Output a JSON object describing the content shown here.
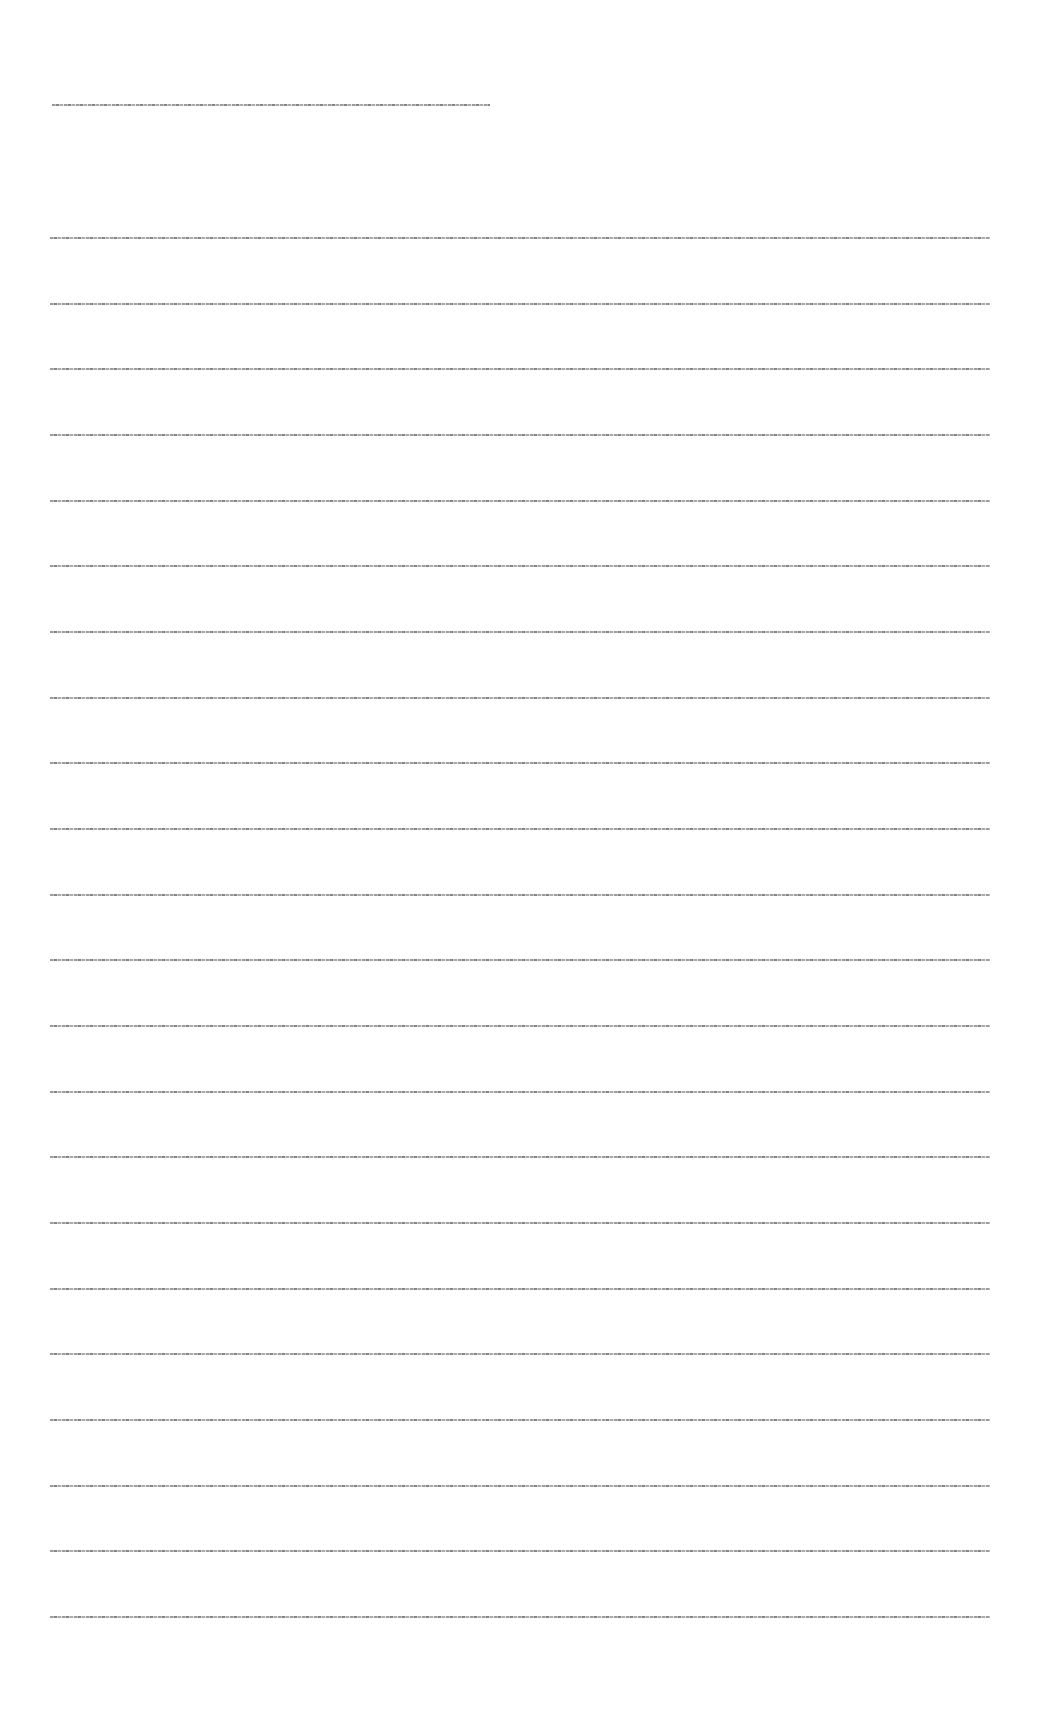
{
  "document": {
    "legibility": "text too small to read",
    "title_line": {
      "text": "",
      "x": 52,
      "y": 104,
      "width": 438
    },
    "body_lines": [
      {
        "text": "",
        "y": 237
      },
      {
        "text": "",
        "y": 303
      },
      {
        "text": "",
        "y": 368
      },
      {
        "text": "",
        "y": 434
      },
      {
        "text": "",
        "y": 500
      },
      {
        "text": "",
        "y": 565
      },
      {
        "text": "",
        "y": 631
      },
      {
        "text": "",
        "y": 697
      },
      {
        "text": "",
        "y": 762
      },
      {
        "text": "",
        "y": 828
      },
      {
        "text": "",
        "y": 894
      },
      {
        "text": "",
        "y": 959
      },
      {
        "text": "",
        "y": 1025
      },
      {
        "text": "",
        "y": 1091
      },
      {
        "text": "",
        "y": 1156
      },
      {
        "text": "",
        "y": 1222
      },
      {
        "text": "",
        "y": 1288
      },
      {
        "text": "",
        "y": 1353
      },
      {
        "text": "",
        "y": 1419
      },
      {
        "text": "",
        "y": 1485
      },
      {
        "text": "",
        "y": 1550
      },
      {
        "text": "",
        "y": 1616
      }
    ],
    "body_line_x": 50,
    "body_line_width": 940,
    "colors": {
      "background": "#ffffff",
      "ink": "#7a7a7a"
    }
  }
}
